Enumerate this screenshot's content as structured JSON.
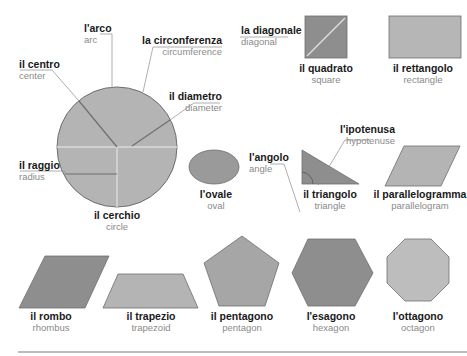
{
  "colors": {
    "shape_fill": "#b4b4b4",
    "shape_dark": "#8e8e8e",
    "shape_stroke": "#6f6f6f",
    "accent_line": "#d8d8d8",
    "leader_line": "#9a9a9a",
    "label_it": "#1a1a1a",
    "label_en": "#8a8a8a"
  },
  "circle_parts": {
    "arc": {
      "it": "l'arco",
      "en": "arc"
    },
    "circumference": {
      "it": "la circonferenza",
      "en": "circumference"
    },
    "center": {
      "it": "il centro",
      "en": "center"
    },
    "diameter": {
      "it": "il diametro",
      "en": "diameter"
    },
    "radius": {
      "it": "il raggio",
      "en": "radius"
    }
  },
  "square_parts": {
    "diagonal": {
      "it": "la diagonale",
      "en": "diagonal"
    }
  },
  "triangle_parts": {
    "angle": {
      "it": "l'angolo",
      "en": "angle"
    },
    "hypotenuse": {
      "it": "l'ipotenusa",
      "en": "hypotenuse"
    }
  },
  "shapes": {
    "circle": {
      "it": "il cerchio",
      "en": "circle"
    },
    "square": {
      "it": "il quadrato",
      "en": "square"
    },
    "rectangle": {
      "it": "il rettangolo",
      "en": "rectangle"
    },
    "oval": {
      "it": "l'ovale",
      "en": "oval"
    },
    "triangle": {
      "it": "il triangolo",
      "en": "triangle"
    },
    "parallelogram": {
      "it": "il parallelogramma",
      "en": "parallelogram"
    },
    "rhombus": {
      "it": "il rombo",
      "en": "rhombus"
    },
    "trapezoid": {
      "it": "il trapezio",
      "en": "trapezoid"
    },
    "pentagon": {
      "it": "il pentagono",
      "en": "pentagon"
    },
    "hexagon": {
      "it": "l'esagono",
      "en": "hexagon"
    },
    "octagon": {
      "it": "l'ottagono",
      "en": "octagon"
    }
  }
}
